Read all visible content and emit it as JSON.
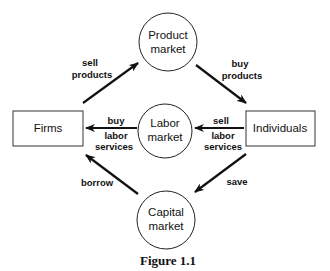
{
  "nodes": {
    "product_market": {
      "line1": "Product",
      "line2": "market"
    },
    "labor_market": {
      "line1": "Labor",
      "line2": "market"
    },
    "capital_market": {
      "line1": "Capital",
      "line2": "market"
    },
    "firms": {
      "label": "Firms"
    },
    "individuals": {
      "label": "Individuals"
    }
  },
  "edges": {
    "sell_products": {
      "line1": "sell",
      "line2": "products"
    },
    "buy_products": {
      "line1": "buy",
      "line2": "products"
    },
    "buy_labor": {
      "line1": "buy",
      "line2": "labor",
      "line3": "services"
    },
    "sell_labor": {
      "line1": "sell",
      "line2": "labor",
      "line3": "services"
    },
    "borrow": {
      "label": "borrow"
    },
    "save": {
      "label": "save"
    }
  },
  "caption": "Figure 1.1"
}
